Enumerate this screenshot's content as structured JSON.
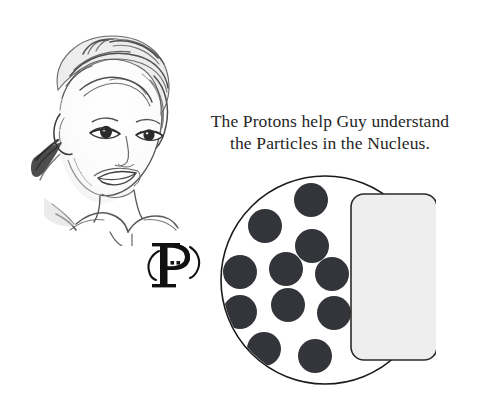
{
  "page": {
    "background_color": "#ffffff",
    "width": 477,
    "height": 413
  },
  "caption": {
    "line1": "The Protons help Guy understand",
    "line2": "the Particles in the Nucleus.",
    "full_text": "The Protons help Guy understand the Particles in the Nucleus.",
    "text_color": "#262626",
    "align": "center"
  },
  "portrait": {
    "name": "child-portrait-sketch",
    "description": "pencil sketch drawing of a smiling child's head and shoulders",
    "style": "graphite pencil sketch",
    "line_color": "#4a4a4a"
  },
  "monogram": {
    "letter": "P",
    "name": "proton-p-monogram",
    "description": "serif capital P with curved bracket ears and two dots inside the bowl",
    "letter_color": "#111111",
    "ear_color": "#111111",
    "dot_count": 2
  },
  "nucleus": {
    "name": "nucleus-diagram",
    "outline_color": "#1a1a1a",
    "fill_color": "#ffffff",
    "particle_color": "#33353a",
    "particle_count": 13,
    "particle_radius": 17,
    "particles": [
      {
        "label": "proton-1",
        "cx": 93,
        "cy": 27
      },
      {
        "label": "proton-2",
        "cx": 47,
        "cy": 53
      },
      {
        "label": "proton-3",
        "cx": 94,
        "cy": 73
      },
      {
        "label": "proton-4",
        "cx": 22,
        "cy": 99
      },
      {
        "label": "proton-5",
        "cx": 68,
        "cy": 96
      },
      {
        "label": "proton-6",
        "cx": 114,
        "cy": 101
      },
      {
        "label": "proton-7",
        "cx": 22,
        "cy": 139
      },
      {
        "label": "proton-8",
        "cx": 70,
        "cy": 132
      },
      {
        "label": "proton-9",
        "cx": 116,
        "cy": 140
      },
      {
        "label": "proton-10",
        "cx": 46,
        "cy": 176
      },
      {
        "label": "proton-11",
        "cx": 97,
        "cy": 183
      },
      {
        "label": "proton-12",
        "cx": 8,
        "cy": 66
      },
      {
        "label": "proton-13",
        "cx": 2,
        "cy": 112
      }
    ],
    "panel": {
      "name": "nucleus-panel",
      "fill_color": "#eeeeee",
      "border_color": "#2b2b2b",
      "corner_radius": 13,
      "x": 133,
      "y": 21,
      "width": 86,
      "height": 166
    }
  }
}
